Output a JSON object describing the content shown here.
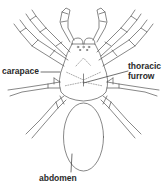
{
  "diagram": {
    "labels": {
      "carapace": "carapace",
      "thoracic_furrow_line1": "thoracic",
      "thoracic_furrow_line2": "furrow",
      "abdomen": "abdomen"
    },
    "colors": {
      "stroke": "#555555",
      "text": "#2a2a2a",
      "background": "#ffffff"
    }
  }
}
